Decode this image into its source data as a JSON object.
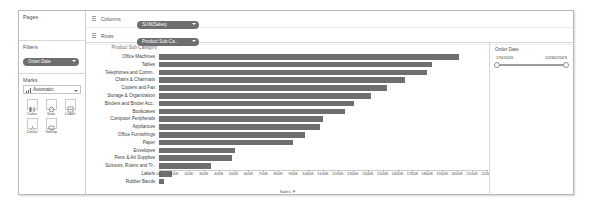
{
  "sidebar": {
    "pages": {
      "title": "Pages"
    },
    "filters": {
      "title": "Filters",
      "pills": [
        "Order Date"
      ]
    },
    "marks": {
      "title": "Marks",
      "mark_type": "Automatic",
      "buttons": [
        {
          "label": "Color",
          "icon": "color-palette-icon"
        },
        {
          "label": "Size",
          "icon": "size-icon"
        },
        {
          "label": "Label",
          "icon": "label-icon"
        },
        {
          "label": "Detail",
          "icon": "detail-icon"
        },
        {
          "label": "Tooltip",
          "icon": "tooltip-icon"
        }
      ]
    }
  },
  "shelves": [
    {
      "name": "Columns",
      "pill": "SUM(Sales)"
    },
    {
      "name": "Rows",
      "pill": "Product Sub-Ca.."
    }
  ],
  "right_panel": {
    "filter_title": "Order Date",
    "range_start": "1/5/2020",
    "range_end": "12/30/2023"
  },
  "chart_data": {
    "type": "bar",
    "title": "",
    "row_header_title": "Product Sub-Category",
    "xlabel": "Sales",
    "xlabel_sort_indicator": "F",
    "ylabel": "Product Sub-Category",
    "orientation": "horizontal",
    "grid": false,
    "legend": "none",
    "xlim": [
      0,
      2200000
    ],
    "bar_color": "#6f6f6f",
    "tick_labels": [
      "0K",
      "100K",
      "200K",
      "300K",
      "400K",
      "500K",
      "600K",
      "700K",
      "800K",
      "900K",
      "1000K",
      "1100K",
      "1200K",
      "1300K",
      "1400K",
      "1500K",
      "1600K",
      "1700K",
      "1800K",
      "1900K",
      "2000K",
      "2100K",
      "2200K"
    ],
    "tick_values": [
      0,
      100000,
      200000,
      300000,
      400000,
      500000,
      600000,
      700000,
      800000,
      900000,
      1000000,
      1100000,
      1200000,
      1300000,
      1400000,
      1500000,
      1600000,
      1700000,
      1800000,
      1900000,
      2000000,
      2100000,
      2200000
    ],
    "categories": [
      "Office Machines",
      "Tables",
      "Telephones and Comm..",
      "Chairs & Chairmats",
      "Copiers and Fax",
      "Storage & Organization",
      "Binders and Binder Acc..",
      "Bookcases",
      "Computer Peripherals",
      "Appliances",
      "Office Furnishings",
      "Paper",
      "Envelopes",
      "Pens & Art Supplies",
      "Scissors, Rulers and Tr..",
      "Labels",
      "Rubber Bands"
    ],
    "values": [
      2010000,
      1830000,
      1800000,
      1650000,
      1530000,
      1420000,
      1310000,
      1250000,
      1100000,
      1080000,
      980000,
      900000,
      510000,
      490000,
      350000,
      85000,
      32000
    ]
  }
}
